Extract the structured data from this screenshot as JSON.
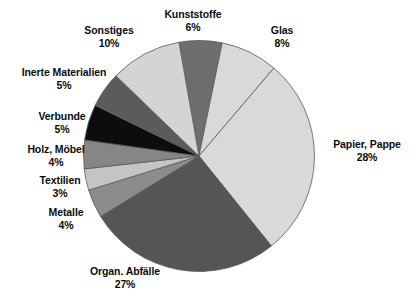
{
  "chart_data": {
    "type": "pie",
    "title": "",
    "subtitle": "",
    "xlabel": "",
    "ylabel": "",
    "legend_position": "none",
    "grid": false,
    "value_unit": "%",
    "total": 100,
    "start_angle_deg": -10,
    "direction": "clockwise",
    "categories": [
      "Kunststoffe",
      "Glas",
      "Papier, Pappe",
      "Organ. Abfälle",
      "Metalle",
      "Textilien",
      "Holz, Möbel",
      "Verbunde",
      "Inerte Materialien",
      "Sonstiges"
    ],
    "values": [
      6,
      8,
      28,
      27,
      4,
      3,
      4,
      5,
      5,
      10
    ],
    "colors": [
      "#6e6e6e",
      "#d9d9d9",
      "#d9d9d9",
      "#555555",
      "#8c8c8c",
      "#c4c4c4",
      "#868686",
      "#0d0d0d",
      "#5b5b5b",
      "#d4d4d4"
    ],
    "slices": [
      {
        "label": "Kunststoffe",
        "value": 6,
        "value_label": "6%",
        "color": "#6e6e6e"
      },
      {
        "label": "Glas",
        "value": 8,
        "value_label": "8%",
        "color": "#d9d9d9"
      },
      {
        "label": "Papier, Pappe",
        "value": 28,
        "value_label": "28%",
        "color": "#d9d9d9"
      },
      {
        "label": "Organ. Abfälle",
        "value": 27,
        "value_label": "27%",
        "color": "#555555"
      },
      {
        "label": "Metalle",
        "value": 4,
        "value_label": "4%",
        "color": "#8c8c8c"
      },
      {
        "label": "Textilien",
        "value": 3,
        "value_label": "3%",
        "color": "#c4c4c4"
      },
      {
        "label": "Holz, Möbel",
        "value": 4,
        "value_label": "4%",
        "color": "#868686"
      },
      {
        "label": "Verbunde",
        "value": 5,
        "value_label": "5%",
        "color": "#0d0d0d"
      },
      {
        "label": "Inerte Materialien",
        "value": 5,
        "value_label": "5%",
        "color": "#5b5b5b"
      },
      {
        "label": "Sonstiges",
        "value": 10,
        "value_label": "10%",
        "color": "#d4d4d4"
      }
    ]
  },
  "labels": {
    "kunststoffe": {
      "name": "Kunststoffe",
      "value": "6%"
    },
    "glas": {
      "name": "Glas",
      "value": "8%"
    },
    "papier_pappe": {
      "name": "Papier, Pappe",
      "value": "28%"
    },
    "organ_abfaelle": {
      "name": "Organ. Abfälle",
      "value": "27%"
    },
    "metalle": {
      "name": "Metalle",
      "value": "4%"
    },
    "textilien": {
      "name": "Textilien",
      "value": "3%"
    },
    "holz_moebel": {
      "name": "Holz, Möbel",
      "value": "4%"
    },
    "verbunde": {
      "name": "Verbunde",
      "value": "5%"
    },
    "inerte_materialien": {
      "name": "Inerte Materialien",
      "value": "5%"
    },
    "sonstiges": {
      "name": "Sonstiges",
      "value": "10%"
    }
  },
  "style": {
    "background": "#ffffff",
    "text_color": "#0b0b0b",
    "slice_border": "#58585a"
  }
}
